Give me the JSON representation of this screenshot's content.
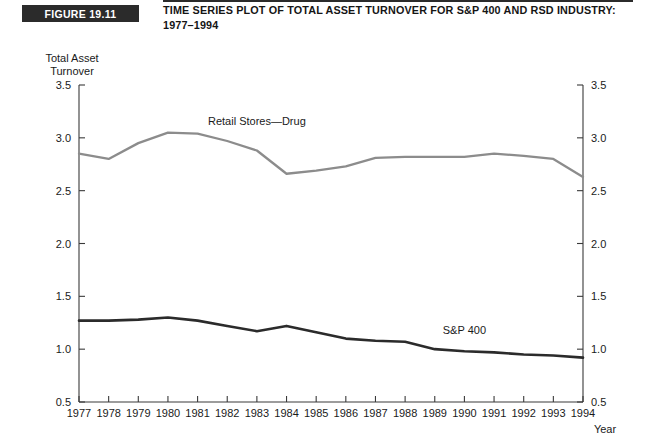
{
  "header": {
    "badge": "FIGURE 19.11",
    "title": "TIME SERIES PLOT OF TOTAL ASSET TURNOVER FOR S&P 400 AND RSD INDUSTRY: 1977–1994"
  },
  "chart_data": {
    "type": "line",
    "title": "TIME SERIES PLOT OF TOTAL ASSET TURNOVER FOR S&P 400 AND RSD INDUSTRY: 1977–1994",
    "xlabel": "Year",
    "ylabel": "Total Asset Turnover",
    "ylabel_line1": "Total Asset",
    "ylabel_line2": "Turnover",
    "ylim": [
      0.5,
      3.5
    ],
    "yticks": [
      "0.5",
      "1.0",
      "1.5",
      "2.0",
      "2.5",
      "3.0",
      "3.5"
    ],
    "ytick_values": [
      0.5,
      1.0,
      1.5,
      2.0,
      2.5,
      3.0,
      3.5
    ],
    "right_axis": true,
    "right_yticks": [
      "0.5",
      "1.0",
      "1.5",
      "2.0",
      "2.5",
      "3.0",
      "3.5"
    ],
    "grid": false,
    "legend_position": "inline-annotation",
    "x": [
      1977,
      1978,
      1979,
      1980,
      1981,
      1982,
      1983,
      1984,
      1985,
      1986,
      1987,
      1988,
      1989,
      1990,
      1991,
      1992,
      1993,
      1994
    ],
    "categories": [
      "1977",
      "1978",
      "1979",
      "1980",
      "1981",
      "1982",
      "1983",
      "1984",
      "1985",
      "1986",
      "1987",
      "1988",
      "1989",
      "1990",
      "1991",
      "1992",
      "1993",
      "1994"
    ],
    "series": [
      {
        "name": "Retail Stores—Drug",
        "color": "#8c8c8c",
        "values": [
          2.85,
          2.8,
          2.95,
          3.05,
          3.04,
          2.97,
          2.88,
          2.66,
          2.69,
          2.73,
          2.81,
          2.82,
          2.82,
          2.82,
          2.85,
          2.83,
          2.8,
          2.63
        ]
      },
      {
        "name": "S&P 400",
        "color": "#2b2b2b",
        "values": [
          1.27,
          1.27,
          1.28,
          1.3,
          1.27,
          1.22,
          1.17,
          1.22,
          1.16,
          1.1,
          1.08,
          1.07,
          1.0,
          0.98,
          0.97,
          0.95,
          0.94,
          0.92
        ]
      }
    ],
    "annotations": [
      {
        "text": "Retail Stores—Drug",
        "x": 1983,
        "y": 3.12
      },
      {
        "text": "S&P 400",
        "x": 1990,
        "y": 1.14
      }
    ]
  }
}
